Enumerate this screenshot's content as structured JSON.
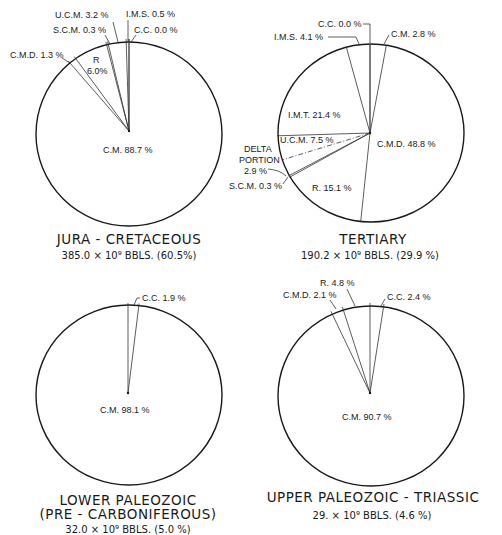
{
  "chart_data": [
    {
      "type": "pie",
      "title": "JURA - CRETACEOUS",
      "subtitle": "385.0 × 10⁹ BBLS. (60.5%)",
      "slices": [
        {
          "name": "C.C.",
          "value": 0.0,
          "label": "C.C. 0.0 %"
        },
        {
          "name": "C.M.",
          "value": 88.7,
          "label": "C.M. 88.7 %"
        },
        {
          "name": "C.M.D.",
          "value": 1.3,
          "label": "C.M.D. 1.3 %"
        },
        {
          "name": "R",
          "value": 6.0,
          "label": "R 6.0 %"
        },
        {
          "name": "S.C.M.",
          "value": 0.3,
          "label": "S.C.M. 0.3 %"
        },
        {
          "name": "U.C.M.",
          "value": 3.2,
          "label": "U.C.M. 3.2 %"
        },
        {
          "name": "I.M.S.",
          "value": 0.5,
          "label": "I.M.S. 0.5 %"
        }
      ]
    },
    {
      "type": "pie",
      "title": "TERTIARY",
      "subtitle": "190.2 × 10⁹ BBLS. (29.9 %)",
      "slices": [
        {
          "name": "C.C.",
          "value": 0.0,
          "label": "C.C. 0.0 %"
        },
        {
          "name": "C.M.",
          "value": 2.8,
          "label": "C.M. 2.8 %"
        },
        {
          "name": "C.M.D.",
          "value": 48.8,
          "label": "C.M.D. 48.8 %"
        },
        {
          "name": "R.",
          "value": 15.1,
          "label": "R. 15.1 %"
        },
        {
          "name": "S.C.M.",
          "value": 0.3,
          "label": "S.C.M. 0.3 %"
        },
        {
          "name": "U.C.M.",
          "value": 7.5,
          "label": "U.C.M. 7.5 %"
        },
        {
          "name": "I.M.T.",
          "value": 21.4,
          "label": "I.M.T. 21.4 %"
        },
        {
          "name": "I.M.S.",
          "value": 4.1,
          "label": "I.M.S. 4.1 %"
        }
      ],
      "annotations": [
        {
          "text": "DELTA PORTION 2.9 %",
          "lines": [
            "DELTA",
            "PORTION",
            "2.9 %"
          ],
          "value": 2.9,
          "within": "U.C.M."
        }
      ]
    },
    {
      "type": "pie",
      "title": "LOWER PALEOZOIC",
      "title2": "(PRE - CARBONIFEROUS)",
      "subtitle": "32.0 × 10⁹ BBLS. (5.0 %)",
      "slices": [
        {
          "name": "C.C.",
          "value": 1.9,
          "label": "C.C. 1.9 %"
        },
        {
          "name": "C.M.",
          "value": 98.1,
          "label": "C.M. 98.1 %"
        }
      ]
    },
    {
      "type": "pie",
      "title": "UPPER PALEOZOIC - TRIASSIC",
      "subtitle": "29. × 10⁹ BBLS. (4.6 %)",
      "slices": [
        {
          "name": "C.C.",
          "value": 2.4,
          "label": "C.C. 2.4 %"
        },
        {
          "name": "C.M.",
          "value": 90.7,
          "label": "C.M. 90.7 %"
        },
        {
          "name": "C.M.D.",
          "value": 2.1,
          "label": "C.M.D. 2.1 %"
        },
        {
          "name": "R.",
          "value": 4.8,
          "label": "R. 4.8 %"
        }
      ]
    }
  ]
}
